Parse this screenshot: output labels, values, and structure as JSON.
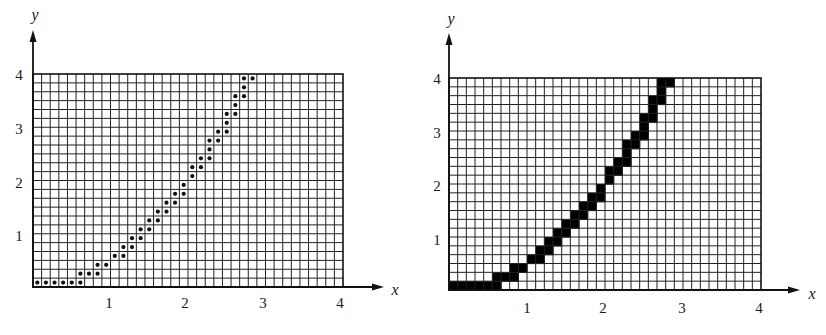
{
  "figures": [
    {
      "id": "left",
      "rendering": "dots",
      "axis_labels": {
        "x": "x",
        "y": "y"
      },
      "x_ticks": [
        "1",
        "2",
        "3",
        "4"
      ],
      "y_ticks": [
        "1",
        "2",
        "3",
        "4"
      ],
      "geometry": {
        "grid_left": 33,
        "grid_top": 74,
        "grid_width": 310,
        "grid_height": 213,
        "y_arrow_top": 30,
        "x_arrow_right": 384,
        "y_label_pos": [
          35,
          14
        ],
        "x_label_pos": [
          395,
          289
        ]
      },
      "color": "#111111"
    },
    {
      "id": "right",
      "rendering": "filled",
      "axis_labels": {
        "x": "x",
        "y": "y"
      },
      "x_ticks": [
        "1",
        "2",
        "3",
        "4"
      ],
      "y_ticks": [
        "1",
        "2",
        "3",
        "4"
      ],
      "geometry": {
        "grid_left": 449,
        "grid_top": 78,
        "grid_width": 312,
        "grid_height": 212,
        "y_arrow_top": 33,
        "x_arrow_right": 800,
        "y_label_pos": [
          451,
          18
        ],
        "x_label_pos": [
          812,
          293
        ]
      },
      "color": "#000000"
    }
  ],
  "chart_data": {
    "type": "heatmap",
    "title": "",
    "xlabel": "x",
    "ylabel": "y",
    "xlim": [
      0,
      4
    ],
    "ylim": [
      0,
      4
    ],
    "x_ticks": [
      1,
      2,
      3,
      4
    ],
    "y_ticks": [
      1,
      2,
      3,
      4
    ],
    "grid": {
      "columns": 36,
      "rows": 24,
      "columns_per_unit": 9,
      "rows_per_unit": 6
    },
    "pixels_by_row": [
      {
        "row": 0,
        "cols": [
          0,
          1,
          2,
          3,
          4,
          5
        ]
      },
      {
        "row": 1,
        "cols": [
          5,
          6,
          7
        ]
      },
      {
        "row": 2,
        "cols": [
          7,
          8
        ]
      },
      {
        "row": 3,
        "cols": [
          9,
          10
        ]
      },
      {
        "row": 4,
        "cols": [
          10,
          11
        ]
      },
      {
        "row": 5,
        "cols": [
          11,
          12
        ]
      },
      {
        "row": 6,
        "cols": [
          12,
          13
        ]
      },
      {
        "row": 7,
        "cols": [
          13,
          14
        ]
      },
      {
        "row": 8,
        "cols": [
          14,
          15
        ]
      },
      {
        "row": 9,
        "cols": [
          15,
          16
        ]
      },
      {
        "row": 10,
        "cols": [
          16,
          17
        ]
      },
      {
        "row": 11,
        "cols": [
          17
        ]
      },
      {
        "row": 12,
        "cols": [
          18
        ]
      },
      {
        "row": 13,
        "cols": [
          18,
          19
        ]
      },
      {
        "row": 14,
        "cols": [
          19,
          20
        ]
      },
      {
        "row": 15,
        "cols": [
          20
        ]
      },
      {
        "row": 16,
        "cols": [
          20,
          21
        ]
      },
      {
        "row": 17,
        "cols": [
          21,
          22
        ]
      },
      {
        "row": 18,
        "cols": [
          22
        ]
      },
      {
        "row": 19,
        "cols": [
          22,
          23
        ]
      },
      {
        "row": 20,
        "cols": [
          23
        ]
      },
      {
        "row": 21,
        "cols": [
          23,
          24
        ]
      },
      {
        "row": 22,
        "cols": [
          24
        ]
      },
      {
        "row": 23,
        "cols": [
          24,
          25
        ]
      }
    ]
  }
}
